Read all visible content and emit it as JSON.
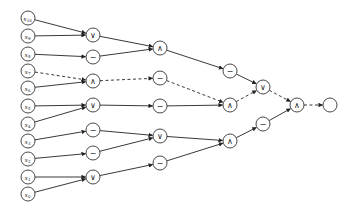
{
  "diagram": {
    "type": "logic circuit / computation tree",
    "node_radius": 7,
    "inputs": [
      {
        "id": "x10",
        "var": "x",
        "sub": "10",
        "x": 28,
        "y": 18
      },
      {
        "id": "x9",
        "var": "x",
        "sub": "9",
        "x": 28,
        "y": 36
      },
      {
        "id": "x8",
        "var": "x",
        "sub": "8",
        "x": 28,
        "y": 54
      },
      {
        "id": "x7",
        "var": "x",
        "sub": "7",
        "x": 28,
        "y": 71
      },
      {
        "id": "x6",
        "var": "x",
        "sub": "6",
        "x": 28,
        "y": 88
      },
      {
        "id": "x5",
        "var": "x",
        "sub": "5",
        "x": 28,
        "y": 106
      },
      {
        "id": "x4",
        "var": "x",
        "sub": "4",
        "x": 28,
        "y": 124
      },
      {
        "id": "x3",
        "var": "x",
        "sub": "3",
        "x": 28,
        "y": 141
      },
      {
        "id": "x2",
        "var": "x",
        "sub": "2",
        "x": 28,
        "y": 159
      },
      {
        "id": "x1",
        "var": "x",
        "sub": "1",
        "x": 28,
        "y": 177
      },
      {
        "id": "x0",
        "var": "x",
        "sub": "0",
        "x": 28,
        "y": 194
      }
    ],
    "gates": [
      {
        "id": "g1a",
        "op": "∨",
        "name": "or",
        "x": 93,
        "y": 35
      },
      {
        "id": "g1b",
        "op": "−",
        "name": "neg",
        "x": 93,
        "y": 57
      },
      {
        "id": "g1c",
        "op": "∧",
        "name": "and",
        "x": 93,
        "y": 81
      },
      {
        "id": "g1d",
        "op": "∨",
        "name": "or",
        "x": 93,
        "y": 105
      },
      {
        "id": "g1e",
        "op": "−",
        "name": "neg",
        "x": 93,
        "y": 130
      },
      {
        "id": "g1f",
        "op": "−",
        "name": "neg",
        "x": 93,
        "y": 153
      },
      {
        "id": "g1g",
        "op": "∨",
        "name": "or",
        "x": 93,
        "y": 177
      },
      {
        "id": "g2a",
        "op": "∧",
        "name": "and",
        "x": 160,
        "y": 48
      },
      {
        "id": "g2b",
        "op": "−",
        "name": "neg",
        "x": 160,
        "y": 78
      },
      {
        "id": "g2c",
        "op": "−",
        "name": "neg",
        "x": 160,
        "y": 106
      },
      {
        "id": "g2d",
        "op": "∨",
        "name": "or",
        "x": 160,
        "y": 136
      },
      {
        "id": "g2e",
        "op": "−",
        "name": "neg",
        "x": 160,
        "y": 163
      },
      {
        "id": "g3a",
        "op": "−",
        "name": "neg",
        "x": 230,
        "y": 71
      },
      {
        "id": "g3b",
        "op": "∧",
        "name": "and",
        "x": 230,
        "y": 105
      },
      {
        "id": "g3c",
        "op": "∧",
        "name": "and",
        "x": 230,
        "y": 141
      },
      {
        "id": "g4a",
        "op": "∨",
        "name": "or",
        "x": 263,
        "y": 87
      },
      {
        "id": "g4b",
        "op": "−",
        "name": "neg",
        "x": 263,
        "y": 124
      },
      {
        "id": "g5a",
        "op": "∧",
        "name": "and",
        "x": 297,
        "y": 105
      },
      {
        "id": "out",
        "op": "",
        "name": "output",
        "x": 330,
        "y": 105
      }
    ],
    "edges": [
      {
        "from": "x10",
        "to": "g1a",
        "dashed": false
      },
      {
        "from": "x9",
        "to": "g1a",
        "dashed": false
      },
      {
        "from": "x8",
        "to": "g1b",
        "dashed": false
      },
      {
        "from": "x7",
        "to": "g1c",
        "dashed": true
      },
      {
        "from": "x6",
        "to": "g1c",
        "dashed": false
      },
      {
        "from": "x5",
        "to": "g1d",
        "dashed": false
      },
      {
        "from": "x4",
        "to": "g1d",
        "dashed": false
      },
      {
        "from": "x3",
        "to": "g1e",
        "dashed": false
      },
      {
        "from": "x2",
        "to": "g1f",
        "dashed": false
      },
      {
        "from": "x1",
        "to": "g1g",
        "dashed": false
      },
      {
        "from": "x0",
        "to": "g1g",
        "dashed": false
      },
      {
        "from": "g1a",
        "to": "g2a",
        "dashed": false
      },
      {
        "from": "g1b",
        "to": "g2a",
        "dashed": false
      },
      {
        "from": "g1c",
        "to": "g2b",
        "dashed": true
      },
      {
        "from": "g1d",
        "to": "g2c",
        "dashed": false
      },
      {
        "from": "g1e",
        "to": "g2d",
        "dashed": false
      },
      {
        "from": "g1f",
        "to": "g2d",
        "dashed": false
      },
      {
        "from": "g1g",
        "to": "g2e",
        "dashed": false
      },
      {
        "from": "g2a",
        "to": "g3a",
        "dashed": false
      },
      {
        "from": "g2b",
        "to": "g3b",
        "dashed": true
      },
      {
        "from": "g2c",
        "to": "g3b",
        "dashed": false
      },
      {
        "from": "g2d",
        "to": "g3c",
        "dashed": false
      },
      {
        "from": "g2e",
        "to": "g3c",
        "dashed": false
      },
      {
        "from": "g3a",
        "to": "g4a",
        "dashed": false
      },
      {
        "from": "g3b",
        "to": "g4a",
        "dashed": true
      },
      {
        "from": "g3c",
        "to": "g4b",
        "dashed": false
      },
      {
        "from": "g4a",
        "to": "g5a",
        "dashed": true
      },
      {
        "from": "g4b",
        "to": "g5a",
        "dashed": false
      },
      {
        "from": "g5a",
        "to": "out",
        "dashed": true
      }
    ]
  }
}
